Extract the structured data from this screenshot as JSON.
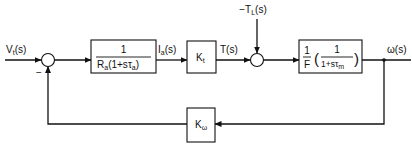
{
  "diagram": {
    "type": "block-diagram",
    "title": "",
    "signals": {
      "input": {
        "main": "V",
        "sub": "t",
        "arg": "(s)"
      },
      "current": {
        "main": "I",
        "sub": "a",
        "arg": "(s)"
      },
      "torque": {
        "main": "T",
        "arg": "(s)"
      },
      "load_torque": {
        "prefix": "−",
        "main": "T",
        "sub": "L",
        "arg": "(s)"
      },
      "output": {
        "main": "ω",
        "arg": "(s)"
      }
    },
    "blocks": {
      "armature": {
        "numerator": "1",
        "den_R": "R",
        "den_R_sub": "a",
        "den_paren_open": "(1+s",
        "den_tau": "τ",
        "den_tau_sub": "a",
        "den_paren_close": ")"
      },
      "torque_constant": {
        "main": "K",
        "sub": "t"
      },
      "mechanical": {
        "outer_num": "1",
        "outer_den": "F",
        "inner_num": "1",
        "inner_den_prefix": "1+s",
        "inner_den_tau": "τ",
        "inner_den_tau_sub": "m",
        "paren_open": "(",
        "paren_close": ")"
      },
      "feedback": {
        "main": "K",
        "sub": "ω"
      }
    },
    "summing_junctions": {
      "sum1": {
        "feedback_sign": "−"
      },
      "sum2": {}
    },
    "colors": {
      "stroke": "#111111",
      "background": "#ffffff"
    }
  }
}
